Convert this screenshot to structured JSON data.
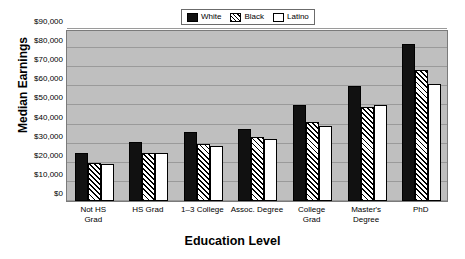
{
  "chart_data": {
    "type": "bar",
    "title": "",
    "xlabel": "Education Level",
    "ylabel": "Median Earnings",
    "categories": [
      "Not HS\nGrad",
      "HS Grad",
      "1–3 College",
      "Assoc. Degree",
      "College\nGrad",
      "Master's Degree",
      "PhD"
    ],
    "series": [
      {
        "name": "White",
        "values": [
          25000,
          31000,
          36000,
          37500,
          50500,
          60000,
          82000
        ]
      },
      {
        "name": "Black",
        "values": [
          20000,
          25000,
          30000,
          33500,
          41500,
          49000,
          68500
        ]
      },
      {
        "name": "Latino",
        "values": [
          19500,
          25000,
          29000,
          32500,
          39500,
          50000,
          61000
        ]
      }
    ],
    "ylim": [
      0,
      90000
    ],
    "ytick_values": [
      0,
      10000,
      20000,
      30000,
      40000,
      50000,
      60000,
      70000,
      80000,
      90000
    ],
    "ytick_labels": [
      "$0",
      "$10,000",
      "$20,000",
      "$30,000",
      "$40,000",
      "$50,000",
      "$60,000",
      "$70,000",
      "$80,000",
      "$90,000"
    ],
    "grid": true,
    "legend_position": "top-center",
    "colors": {
      "white_series": "#111111",
      "black_series_fill": "#ffffff",
      "black_series_hatch": "#000000",
      "latino_series": "#ffffff",
      "plot_background": "#bfbfbf",
      "gridline": "#9a9a9a",
      "axis": "#7a7a7a",
      "text": "#000000"
    }
  },
  "legend": {
    "entries": [
      {
        "label": "White",
        "swatch": "solid-black-swatch"
      },
      {
        "label": "Black",
        "swatch": "diagonal-hatch-swatch"
      },
      {
        "label": "Latino",
        "swatch": "empty-white-swatch"
      }
    ]
  }
}
